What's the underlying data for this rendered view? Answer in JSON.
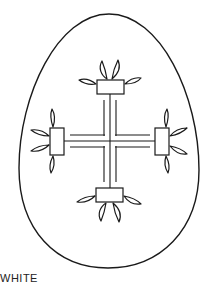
{
  "figure": {
    "type": "coloring-page",
    "caption": "WHITE",
    "colors": {
      "line": "#1a1a1a",
      "background": "#ffffff"
    }
  }
}
